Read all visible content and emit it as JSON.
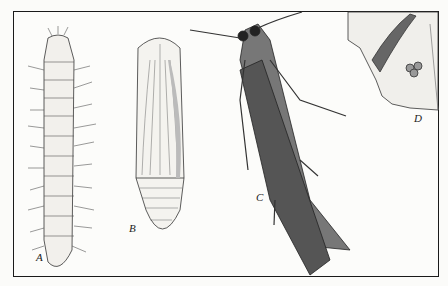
{
  "figure": {
    "panels": [
      {
        "id": "A",
        "label": "A",
        "subject": "larva (caterpillar)"
      },
      {
        "id": "B",
        "label": "B",
        "subject": "pupa"
      },
      {
        "id": "C",
        "label": "C",
        "subject": "adult moth"
      },
      {
        "id": "D",
        "label": "D",
        "subject": "larva on leaf with eggs"
      }
    ]
  },
  "colors": {
    "ink": "#1a1a1a",
    "paper": "#fbfbf9"
  }
}
